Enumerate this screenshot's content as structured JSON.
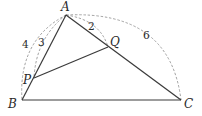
{
  "diagram": {
    "type": "geometry",
    "points": {
      "A": {
        "label": "A",
        "x": 66,
        "y": 15
      },
      "B": {
        "label": "B",
        "x": 22,
        "y": 100
      },
      "C": {
        "label": "C",
        "x": 181,
        "y": 100
      },
      "P": {
        "label": "P",
        "x": 34,
        "y": 78
      },
      "Q": {
        "label": "Q",
        "x": 108,
        "y": 47
      }
    },
    "segments": [
      "AB",
      "AC",
      "BC",
      "PQ"
    ],
    "arcs": [
      {
        "from": "A",
        "to": "B",
        "label": "4"
      },
      {
        "from": "A",
        "to": "P",
        "label": "3"
      },
      {
        "from": "A",
        "to": "Q",
        "label": "2"
      },
      {
        "from": "A",
        "to": "C",
        "label": "6"
      }
    ]
  },
  "labels": {
    "A": "A",
    "B": "B",
    "C": "C",
    "P": "P",
    "Q": "Q",
    "AB_len": "4",
    "AP_len": "3",
    "AQ_len": "2",
    "AC_len": "6"
  }
}
